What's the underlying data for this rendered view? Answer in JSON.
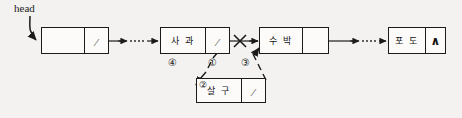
{
  "diagram": {
    "type": "singly-linked-list-insertion",
    "background_color": "#f3f2f0",
    "ink_color": "#1b1b1b",
    "head_pointer": {
      "label": "head",
      "arrow": "curved-arrow-to-head-node"
    },
    "nodes": [
      {
        "id": "head-cell",
        "data": "",
        "link": "pointer-slash",
        "link_symbol": "⁄",
        "role": "head-node-empty-data"
      },
      {
        "id": "sagwa",
        "data": "사 과",
        "link": "pointer-slash",
        "link_symbol": "⁄",
        "role": "list-node"
      },
      {
        "id": "subak",
        "data": "수 박",
        "link": "pointer-slash",
        "link_symbol": "⁄",
        "role": "list-node"
      },
      {
        "id": "podo",
        "data": "포 도",
        "link": "null",
        "link_symbol": "∧",
        "role": "tail-node-null"
      },
      {
        "id": "salgu",
        "data": "살 구",
        "link": "pointer-slash",
        "link_symbol": "⁄",
        "role": "new-node-being-inserted"
      }
    ],
    "step_markers": [
      {
        "id": "step-1",
        "label": "①",
        "meaning": "existing-link-sagwa-to-subak"
      },
      {
        "id": "step-2",
        "label": "②",
        "meaning": "new-node-created"
      },
      {
        "id": "step-3",
        "label": "③",
        "meaning": "new-node-link-to-subak"
      },
      {
        "id": "step-4",
        "label": "④",
        "meaning": "sagwa-link-to-new-node"
      }
    ],
    "cut_mark": {
      "label": "✕",
      "meaning": "broken-link-between-sagwa-and-subak"
    },
    "ellipsis_segments": [
      {
        "id": "ellipsis-1",
        "between": "head-cell→sagwa"
      },
      {
        "id": "ellipsis-2",
        "between": "subak→podo"
      }
    ]
  }
}
